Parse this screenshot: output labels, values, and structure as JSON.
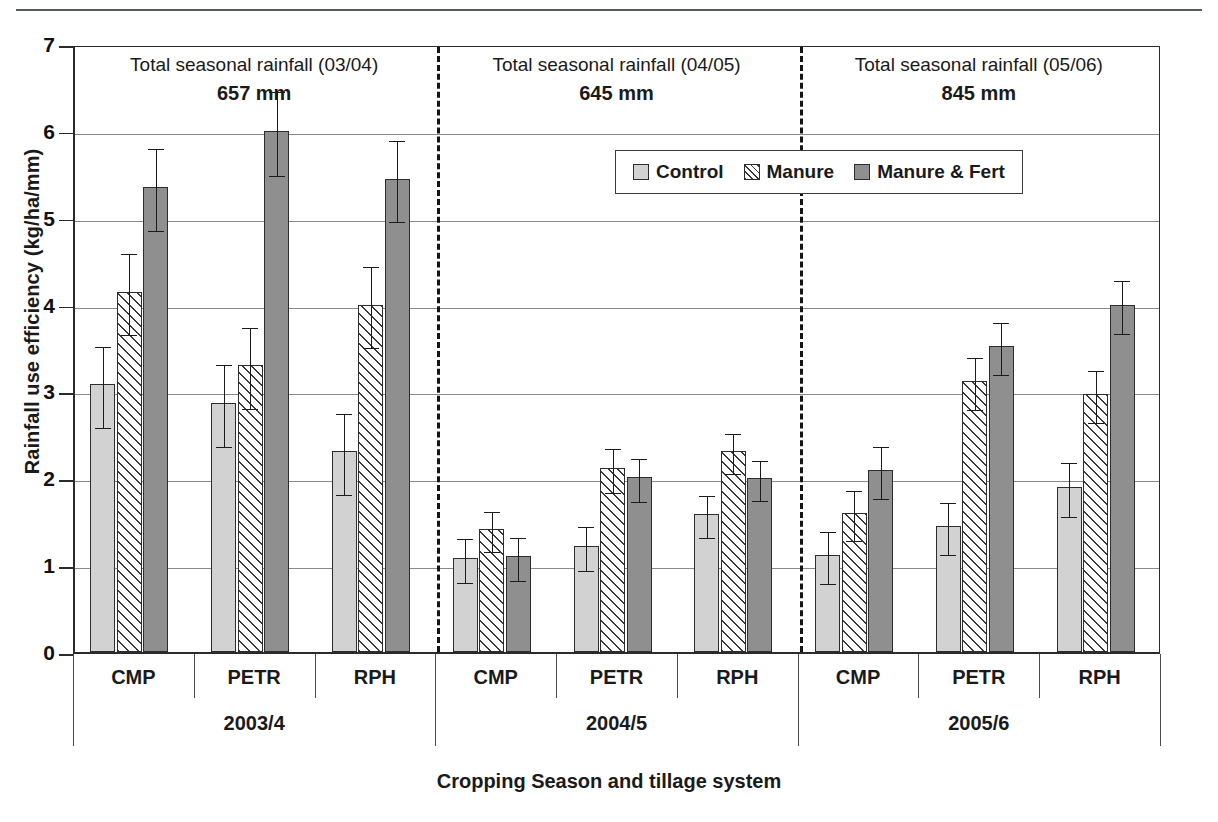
{
  "axes": {
    "ylabel": "Rainfall use efficiency (kg/ha/mm)",
    "xlabel": "Cropping Season and tillage system",
    "yticks": [
      "0",
      "1",
      "2",
      "3",
      "4",
      "5",
      "6",
      "7"
    ]
  },
  "legend": {
    "items": [
      {
        "label": "Control",
        "swatch": "control"
      },
      {
        "label": "Manure",
        "swatch": "manure"
      },
      {
        "label": "Manure & Fert",
        "swatch": "manurefert"
      }
    ]
  },
  "panels": [
    {
      "header": "Total seasonal rainfall (03/04)",
      "rainfall": "657 mm",
      "season": "2003/4"
    },
    {
      "header": "Total seasonal rainfall (04/05)",
      "rainfall": "645 mm",
      "season": "2004/5"
    },
    {
      "header": "Total seasonal rainfall (05/06)",
      "rainfall": "845 mm",
      "season": "2005/6"
    }
  ],
  "tillage_labels": [
    "CMP",
    "PETR",
    "RPH",
    "CMP",
    "PETR",
    "RPH",
    "CMP",
    "PETR",
    "RPH"
  ],
  "colors": {
    "control": "#d2d2d2",
    "manure": "#ffffff",
    "manure_fert": "#8f8f8f",
    "axis": "#2b2b2b",
    "grid": "#8a8a8a"
  },
  "chart_data": {
    "type": "bar",
    "title": "",
    "xlabel": "Cropping Season and tillage system",
    "ylabel": "Rainfall use efficiency (kg/ha/mm)",
    "ylim": [
      0,
      7
    ],
    "ytick_step": 1,
    "grid": true,
    "legend_position": "top-center",
    "categories": [
      "2003/4 CMP",
      "2003/4 PETR",
      "2003/4 RPH",
      "2004/5 CMP",
      "2004/5 PETR",
      "2004/5 RPH",
      "2005/6 CMP",
      "2005/6 PETR",
      "2005/6 RPH"
    ],
    "series": [
      {
        "name": "Control",
        "values": [
          3.08,
          2.87,
          2.31,
          1.08,
          1.22,
          1.59,
          1.12,
          1.45,
          1.9
        ],
        "errors": [
          0.47,
          0.47,
          0.47,
          0.25,
          0.25,
          0.24,
          0.3,
          0.3,
          0.31
        ]
      },
      {
        "name": "Manure",
        "values": [
          4.15,
          3.3,
          4.0,
          1.42,
          2.12,
          2.31,
          1.6,
          3.12,
          2.97
        ],
        "errors": [
          0.47,
          0.47,
          0.47,
          0.23,
          0.25,
          0.23,
          0.29,
          0.3,
          0.3
        ]
      },
      {
        "name": "Manure & Fert",
        "values": [
          5.35,
          6.0,
          5.45,
          1.1,
          2.01,
          2.0,
          2.1,
          3.52,
          4.0
        ],
        "errors": [
          0.47,
          0.48,
          0.47,
          0.25,
          0.25,
          0.23,
          0.3,
          0.3,
          0.31
        ]
      }
    ],
    "panel_annotations": [
      {
        "season": "2003/4",
        "text": "Total seasonal rainfall (03/04)",
        "rainfall_mm": 657
      },
      {
        "season": "2004/5",
        "text": "Total seasonal rainfall (04/05)",
        "rainfall_mm": 645
      },
      {
        "season": "2005/6",
        "text": "Total seasonal rainfall (05/06)",
        "rainfall_mm": 845
      }
    ]
  }
}
